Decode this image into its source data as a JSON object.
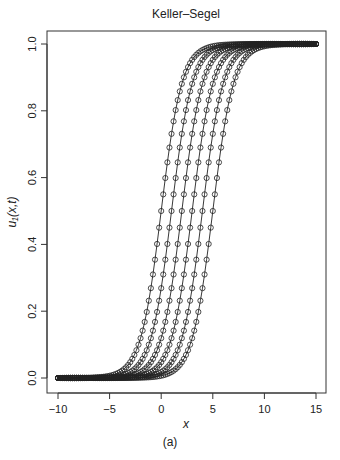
{
  "caption": "(a)",
  "chart_data": {
    "type": "line",
    "title": "Keller–Segel",
    "xlabel": "x",
    "ylabel": "u₁(x,t)",
    "xlim": [
      -10,
      15
    ],
    "ylim": [
      0,
      1
    ],
    "xticks": [
      -10,
      -5,
      0,
      5,
      10,
      15
    ],
    "xtick_labels": [
      "−10",
      "−5",
      "0",
      "5",
      "10",
      "15"
    ],
    "yticks": [
      0.0,
      0.2,
      0.4,
      0.6,
      0.8,
      1.0
    ],
    "ytick_labels": [
      "0.0",
      "0.2",
      "0.4",
      "0.6",
      "0.8",
      "1.0"
    ],
    "grid": false,
    "legend": null,
    "marker": "open-circle",
    "line_style": "solid-with-markers",
    "model": "u(x) = 1 / (1 + exp(-(x - center) / width))",
    "x_sampling": {
      "start": -10,
      "end": 15,
      "step": 0.2
    },
    "series": [
      {
        "name": "t1",
        "center": 0,
        "width": 1.0,
        "values_at": {
          "x": [
            -4,
            -2,
            0,
            2,
            4
          ],
          "u": [
            0.018,
            0.119,
            0.5,
            0.881,
            0.982
          ]
        }
      },
      {
        "name": "t2",
        "center": 1,
        "width": 1.0,
        "values_at": {
          "x": [
            -3,
            -1,
            1,
            3,
            5
          ],
          "u": [
            0.018,
            0.119,
            0.5,
            0.881,
            0.982
          ]
        }
      },
      {
        "name": "t3",
        "center": 2,
        "width": 1.0,
        "values_at": {
          "x": [
            -2,
            0,
            2,
            4,
            6
          ],
          "u": [
            0.018,
            0.119,
            0.5,
            0.881,
            0.982
          ]
        }
      },
      {
        "name": "t4",
        "center": 3,
        "width": 1.0,
        "values_at": {
          "x": [
            -1,
            1,
            3,
            5,
            7
          ],
          "u": [
            0.018,
            0.119,
            0.5,
            0.881,
            0.982
          ]
        }
      },
      {
        "name": "t5",
        "center": 4,
        "width": 1.0,
        "values_at": {
          "x": [
            0,
            2,
            4,
            6,
            8
          ],
          "u": [
            0.018,
            0.119,
            0.5,
            0.881,
            0.982
          ]
        }
      },
      {
        "name": "t6",
        "center": 5,
        "width": 1.0,
        "values_at": {
          "x": [
            1,
            3,
            5,
            7,
            9
          ],
          "u": [
            0.018,
            0.119,
            0.5,
            0.881,
            0.982
          ]
        }
      }
    ]
  }
}
